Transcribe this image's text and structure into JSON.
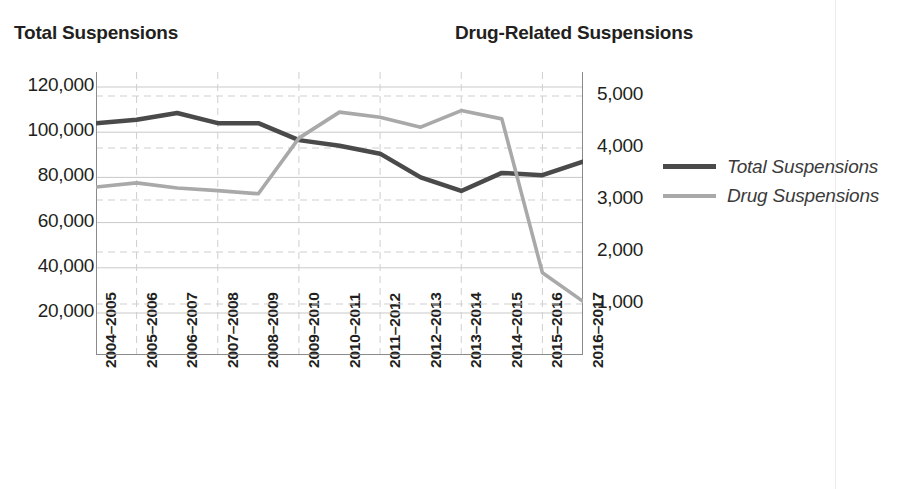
{
  "chart_data": {
    "type": "line",
    "title": "",
    "subtitle": "",
    "xlabel": "",
    "categories": [
      "2004–2005",
      "2005–2006",
      "2006–2007",
      "2007–2008",
      "2008–2009",
      "2009–2010",
      "2010–2011",
      "2011–2012",
      "2012–2013",
      "2013–2014",
      "2014–2015",
      "2015–2016",
      "2016–2017"
    ],
    "series": [
      {
        "name": "Total Suspensions",
        "axis": "left",
        "color": "#4a4a4a",
        "values": [
          104000,
          105500,
          108500,
          104000,
          104000,
          96500,
          94000,
          90500,
          80000,
          74000,
          82000,
          81000,
          87000
        ]
      },
      {
        "name": "Drug Suspensions",
        "axis": "right",
        "color": "#a9a9a9",
        "values": [
          3250,
          3330,
          3230,
          3180,
          3120,
          4190,
          4690,
          4590,
          4400,
          4720,
          4560,
          1600,
          1050
        ]
      }
    ],
    "left_axis": {
      "label": "Total Suspensions",
      "ticks": [
        "20,000",
        "40,000",
        "60,000",
        "80,000",
        "100,000",
        "120,000"
      ],
      "tick_values": [
        20000,
        40000,
        60000,
        80000,
        100000,
        120000
      ],
      "min": 0,
      "max": 130000,
      "gridline_style": "solid"
    },
    "right_axis": {
      "label": "Drug-Related Suspensions",
      "ticks": [
        "1,000",
        "2,000",
        "3,000",
        "4,000",
        "5,000"
      ],
      "tick_values": [
        1000,
        2000,
        3000,
        4000,
        5000
      ],
      "min": 0,
      "max": 5420,
      "gridline_style": "dashed"
    },
    "grid": true,
    "legend_position": "right",
    "legend": [
      {
        "label": "Total Suspensions",
        "color": "#4a4a4a",
        "weight": "thick"
      },
      {
        "label": "Drug Suspensions",
        "color": "#a9a9a9",
        "weight": "thin"
      }
    ]
  },
  "colors": {
    "total_line": "#4a4a4a",
    "drug_line": "#a9a9a9",
    "solid_grid": "#c9c9c9",
    "dashed_grid": "#cfcfcf",
    "axis": "#8a8a8a",
    "text": "#231f20"
  }
}
